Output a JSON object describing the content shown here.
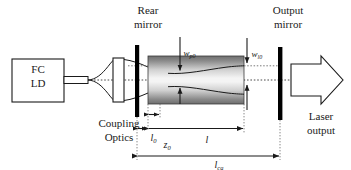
{
  "figure": {
    "type": "optical-schematic",
    "background_color": "#ffffff",
    "line_color": "#1a1a1a",
    "mirror_color": "#000000",
    "dotted_color": "#555555"
  },
  "source": {
    "label_line1": "FC",
    "label_line2": "LD"
  },
  "coupling": {
    "label_line1": "Coupling",
    "label_line2": "Optics"
  },
  "rear_mirror": {
    "label_line1": "Rear",
    "label_line2": "mirror"
  },
  "output_mirror": {
    "label_line1": "Output",
    "label_line2": "mirror"
  },
  "output_beam": {
    "label_line1": "Laser",
    "label_line2": "output"
  },
  "waists": [
    {
      "name": "pump-waist",
      "symbol": "w",
      "subscript": "p0"
    },
    {
      "name": "laser-waist",
      "symbol": "w",
      "subscript": "l0"
    }
  ],
  "dimensions": [
    {
      "name": "l0",
      "symbol": "l",
      "subscript": "0"
    },
    {
      "name": "z0",
      "symbol": "z",
      "subscript": "0"
    },
    {
      "name": "l",
      "symbol": "l",
      "subscript": ""
    },
    {
      "name": "lca",
      "symbol": "l",
      "subscript": "ca"
    }
  ]
}
